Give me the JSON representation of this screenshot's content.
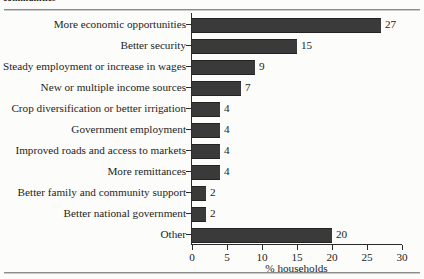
{
  "page": {
    "caption_sliver": "communities"
  },
  "chart_data": {
    "type": "bar",
    "orientation": "horizontal",
    "title": "",
    "xlabel": "% households",
    "ylabel": "",
    "xlim": [
      0,
      30
    ],
    "xticks": [
      0,
      5,
      10,
      15,
      20,
      25,
      30
    ],
    "grid": false,
    "legend": null,
    "bar_color": "#3a3a3a",
    "categories": [
      "More economic opportunities",
      "Better security",
      "Steady employment or increase in wages",
      "New or multiple income sources",
      "Crop diversification or better irrigation",
      "Government employment",
      "Improved roads and access to markets",
      "More remittances",
      "Better family and community support",
      "Better national government",
      "Other"
    ],
    "values": [
      27,
      15,
      9,
      7,
      4,
      4,
      4,
      4,
      2,
      2,
      20
    ],
    "data_labels": [
      "27",
      "15",
      "9",
      "7",
      "4",
      "4",
      "4",
      "4",
      "2",
      "2",
      "20"
    ]
  }
}
